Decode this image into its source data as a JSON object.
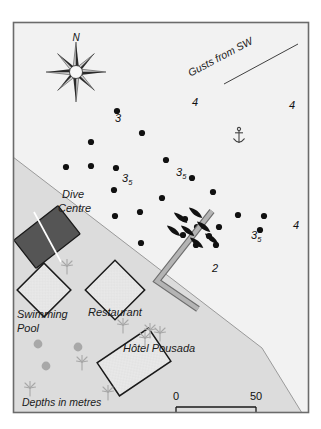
{
  "map": {
    "title": "Coastal anchorage chart",
    "frame": {
      "border_color": "#6b6b6b",
      "x": 13,
      "y": 22,
      "w": 296,
      "h": 391
    },
    "colors": {
      "water": "#f2f2f2",
      "land": "#dcdcdc",
      "outline": "#1a1a1a",
      "jetty": "#a9a9a9",
      "jetty_edge": "#6e6e6e",
      "dive_centre_fill": "#555555",
      "building_fill": "#e4e4e4",
      "vegetation": "#a8a8a8",
      "sounding_dot": "#111111",
      "boat": "#111111"
    },
    "compass": {
      "label": "N",
      "cx": 76,
      "cy": 72,
      "radius": 30,
      "points": 8
    },
    "wind_note": {
      "text": "Gusts from SW",
      "angle_deg": -28,
      "x": 222,
      "y": 60
    },
    "anchor_symbol": {
      "name": "anchor-icon",
      "x": 239,
      "y": 136
    },
    "scale_bar": {
      "start_label": "0",
      "end_label": "50",
      "units": "metres",
      "x": 176,
      "y": 404,
      "length": 80
    },
    "legend": {
      "depths_note": "Depths in metres",
      "x": 22,
      "y": 406
    },
    "shoreline": {
      "description": "diagonal coast from left edge to lower right corner",
      "points": "13,157 94,219 180,285 262,348 300,411"
    },
    "places": [
      {
        "name": "dive-centre",
        "label": "Dive\nCentre",
        "label_lines": [
          "Dive",
          "Centre"
        ],
        "label_x": 62,
        "label_y": 198,
        "shape": "rect-rotated",
        "cx": 47,
        "cy": 237,
        "w": 56,
        "h": 36,
        "rot": -38,
        "fill": "#555555",
        "slash": true
      },
      {
        "name": "swimming-pool",
        "label": "Swimming\nPool",
        "label_lines": [
          "Swimming",
          "Pool"
        ],
        "label_x": 17,
        "label_y": 318,
        "shape": "diamond",
        "cx": 44,
        "cy": 290,
        "size": 27,
        "rot": 45,
        "fill": "#e4e4e4"
      },
      {
        "name": "restaurant",
        "label": "Restaurant",
        "label_lines": [
          "Restaurant"
        ],
        "label_x": 88,
        "label_y": 316,
        "shape": "diamond",
        "cx": 115,
        "cy": 290,
        "size": 30,
        "rot": 45,
        "fill": "#e4e4e4"
      },
      {
        "name": "hotel-pousada",
        "label": "Hôtel Pousada",
        "label_lines": [
          "Hôtel Pousada"
        ],
        "label_x": 123,
        "label_y": 352,
        "shape": "rect-rotated",
        "cx": 134,
        "cy": 362,
        "w": 62,
        "h": 40,
        "rot": -34,
        "fill": "#e4e4e4"
      }
    ],
    "soundings": [
      {
        "x": 117,
        "y": 111
      },
      {
        "x": 142,
        "y": 133
      },
      {
        "x": 91,
        "y": 142
      },
      {
        "x": 66,
        "y": 167
      },
      {
        "x": 116,
        "y": 168
      },
      {
        "x": 166,
        "y": 160
      },
      {
        "x": 192,
        "y": 178
      },
      {
        "x": 91,
        "y": 166
      },
      {
        "x": 140,
        "y": 212
      },
      {
        "x": 114,
        "y": 190
      },
      {
        "x": 162,
        "y": 198
      },
      {
        "x": 213,
        "y": 192
      },
      {
        "x": 115,
        "y": 216
      },
      {
        "x": 238,
        "y": 215
      },
      {
        "x": 264,
        "y": 216
      },
      {
        "x": 185,
        "y": 219
      },
      {
        "x": 197,
        "y": 227
      },
      {
        "x": 209,
        "y": 236
      },
      {
        "x": 219,
        "y": 227
      },
      {
        "x": 260,
        "y": 230
      },
      {
        "x": 183,
        "y": 235
      },
      {
        "x": 196,
        "y": 245
      },
      {
        "x": 216,
        "y": 245
      },
      {
        "x": 141,
        "y": 243
      }
    ],
    "depth_values": [
      {
        "text": "3",
        "sub": "",
        "x": 115,
        "y": 122
      },
      {
        "text": "4",
        "sub": "",
        "x": 192,
        "y": 106
      },
      {
        "text": "4",
        "sub": "",
        "x": 289,
        "y": 109
      },
      {
        "text": "3",
        "sub": "5",
        "x": 122,
        "y": 182
      },
      {
        "text": "3",
        "sub": "5",
        "x": 176,
        "y": 176
      },
      {
        "text": "3",
        "sub": "5",
        "x": 251,
        "y": 239
      },
      {
        "text": "4",
        "sub": "",
        "x": 293,
        "y": 229
      },
      {
        "text": "2",
        "sub": "",
        "x": 212,
        "y": 272
      }
    ],
    "jetty": {
      "name": "jetty-pier",
      "arm_a": "212,211 157,281",
      "arm_b": "157,281 198,309"
    },
    "boats": [
      {
        "x": 181,
        "y": 218,
        "rot": -52
      },
      {
        "x": 196,
        "y": 213,
        "rot": -52
      },
      {
        "x": 188,
        "y": 231,
        "rot": -52
      },
      {
        "x": 204,
        "y": 227,
        "rot": -52
      },
      {
        "x": 174,
        "y": 231,
        "rot": -52
      },
      {
        "x": 212,
        "y": 239,
        "rot": -52
      },
      {
        "x": 197,
        "y": 243,
        "rot": -52
      }
    ],
    "vegetation": {
      "palms": [
        {
          "x": 67,
          "y": 266
        },
        {
          "x": 123,
          "y": 325
        },
        {
          "x": 150,
          "y": 330
        },
        {
          "x": 82,
          "y": 362
        },
        {
          "x": 108,
          "y": 392
        },
        {
          "x": 30,
          "y": 388
        },
        {
          "x": 145,
          "y": 338
        },
        {
          "x": 160,
          "y": 333
        }
      ],
      "bushes": [
        {
          "x": 38,
          "y": 344
        },
        {
          "x": 78,
          "y": 347
        },
        {
          "x": 46,
          "y": 366
        }
      ]
    }
  }
}
